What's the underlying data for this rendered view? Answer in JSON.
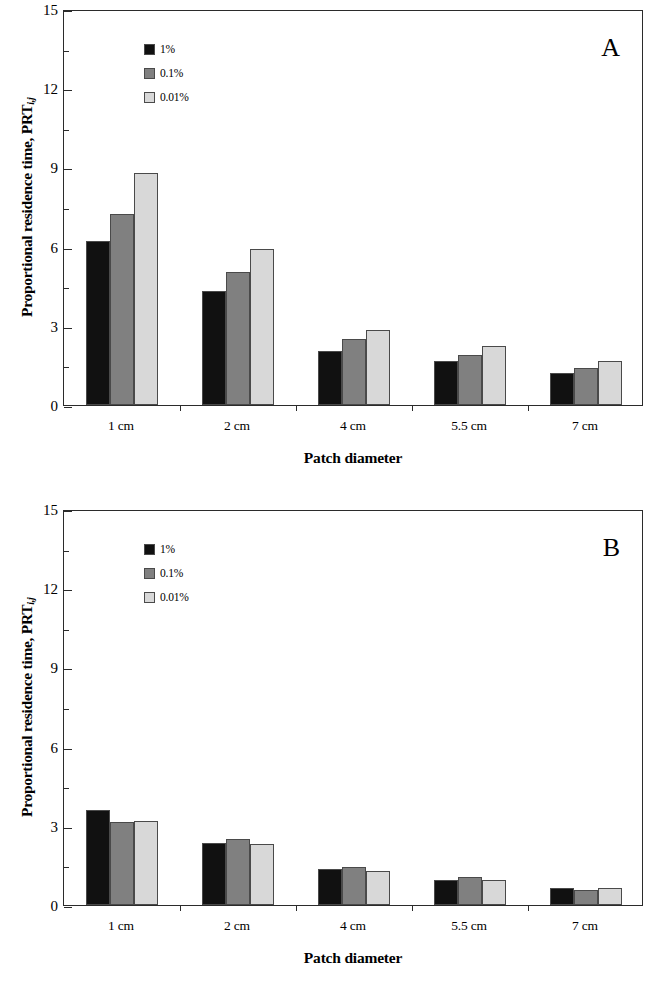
{
  "figure": {
    "panels": [
      {
        "letter": "A",
        "ylabel_main": "Proportional residence time, PRT",
        "ylabel_sub": "i,j",
        "xlabel": "Patch diameter"
      },
      {
        "letter": "B",
        "ylabel_main": "Proportional residence time, PRT",
        "ylabel_sub": "i,j",
        "xlabel": "Patch diameter"
      }
    ],
    "legend": {
      "entries": [
        {
          "label": "1%",
          "color": "#111111"
        },
        {
          "label": "0.1%",
          "color": "#808080"
        },
        {
          "label": "0.01%",
          "color": "#d8d8d8"
        }
      ]
    },
    "axis": {
      "y_ticks": [
        "0",
        "3",
        "6",
        "9",
        "12",
        "15"
      ],
      "x_ticks": [
        "1 cm",
        "2 cm",
        "4 cm",
        "5.5 cm",
        "7 cm"
      ]
    }
  },
  "chart_data": [
    {
      "type": "bar",
      "title": "A",
      "xlabel": "Patch diameter",
      "ylabel": "Proportional residence time, PRT i,j",
      "categories": [
        "1 cm",
        "2 cm",
        "4 cm",
        "5.5 cm",
        "7 cm"
      ],
      "ylim": [
        0,
        15
      ],
      "yticks": [
        0,
        3,
        6,
        9,
        12,
        15
      ],
      "grid": false,
      "legend_position": "top-left",
      "series": [
        {
          "name": "1%",
          "color": "#111111",
          "values": [
            6.2,
            4.3,
            2.05,
            1.65,
            1.2
          ]
        },
        {
          "name": "0.1%",
          "color": "#808080",
          "values": [
            7.25,
            5.05,
            2.5,
            1.9,
            1.4
          ]
        },
        {
          "name": "0.01%",
          "color": "#d8d8d8",
          "values": [
            8.8,
            5.9,
            2.85,
            2.25,
            1.65
          ]
        }
      ]
    },
    {
      "type": "bar",
      "title": "B",
      "xlabel": "Patch diameter",
      "ylabel": "Proportional residence time, PRT i,j",
      "categories": [
        "1 cm",
        "2 cm",
        "4 cm",
        "5.5 cm",
        "7 cm"
      ],
      "ylim": [
        0,
        15
      ],
      "yticks": [
        0,
        3,
        6,
        9,
        12,
        15
      ],
      "grid": false,
      "legend_position": "top-left",
      "series": [
        {
          "name": "1%",
          "color": "#111111",
          "values": [
            3.6,
            2.35,
            1.35,
            0.95,
            0.65
          ]
        },
        {
          "name": "0.1%",
          "color": "#808080",
          "values": [
            3.15,
            2.5,
            1.45,
            1.05,
            0.55
          ]
        },
        {
          "name": "0.01%",
          "color": "#d8d8d8",
          "values": [
            3.2,
            2.3,
            1.3,
            0.95,
            0.65
          ]
        }
      ]
    }
  ]
}
